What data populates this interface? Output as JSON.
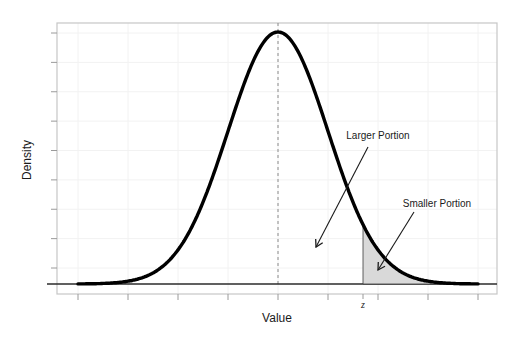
{
  "axes": {
    "xlabel": "Value",
    "ylabel": "Density",
    "x_tick_labels": [],
    "y_tick_labels": [],
    "z_tick_label": "z"
  },
  "annotations": {
    "larger": "Larger Portion",
    "smaller": "Smaller Portion"
  },
  "colors": {
    "background": "#ffffff",
    "curve": "#000000",
    "shade_fill": "#d9d9d9",
    "shade_edge": "#3a3a3a",
    "frame": "#c6c6c6",
    "grid": "#f2f2f2",
    "tick": "#9a9a9a",
    "dashed_line": "#8a8a8a",
    "baseline": "#2b2b2b",
    "text": "#1a1a1a"
  },
  "chart_data": {
    "type": "area",
    "title": "",
    "xlabel": "Value",
    "ylabel": "Density",
    "distribution": "normal",
    "mean": 0,
    "sd": 1,
    "peak_density": 0.3989,
    "z_cutoff": 1.7,
    "shaded_region": "right_tail_beyond_z",
    "curve_x_range": [
      -4,
      4
    ],
    "x_axis_range": [
      -4.5,
      4.5
    ],
    "y_axis_range": [
      0,
      0.41
    ],
    "x_ticks": [
      -4,
      -3,
      -2,
      -1,
      0,
      1,
      2,
      3,
      4
    ],
    "y_tick_count": 9,
    "grid": true,
    "legend": "none",
    "mean_line": "dashed vertical line at mean",
    "annotations": [
      {
        "text": "Larger Portion",
        "points_to": "unshaded area under curve left of z"
      },
      {
        "text": "Smaller Portion",
        "points_to": "shaded tail area right of z"
      }
    ]
  }
}
